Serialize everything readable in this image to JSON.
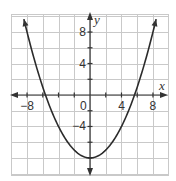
{
  "chart_data": {
    "type": "line",
    "title": "",
    "function": "y = 0.25x^2 - 8",
    "series": [
      {
        "name": "parabola",
        "x": [
          -8.4,
          -8,
          -7,
          -6,
          -5.66,
          -5,
          -4,
          -3,
          -2,
          -1,
          0,
          1,
          2,
          3,
          4,
          5,
          5.66,
          6,
          7,
          8,
          8.4
        ],
        "y": [
          9.64,
          8,
          4.25,
          1,
          0,
          -1.75,
          -4,
          -5.75,
          -7,
          -7.75,
          -8,
          -7.75,
          -7,
          -5.75,
          -4,
          -1.75,
          0,
          1,
          4.25,
          8,
          9.64
        ]
      }
    ],
    "vertex": [
      0,
      -8
    ],
    "x_intercepts": [
      -5.66,
      5.66
    ],
    "xlabel": "x",
    "ylabel": "y",
    "xlim": [
      -10,
      10
    ],
    "ylim": [
      -10,
      10
    ],
    "grid": true,
    "grid_step": 2,
    "x_tick_labels": [
      {
        "value": -8,
        "label": "−8"
      },
      {
        "value": 4,
        "label": "4"
      },
      {
        "value": 8,
        "label": "8"
      }
    ],
    "y_tick_labels": [
      {
        "value": 8,
        "label": "8"
      },
      {
        "value": 4,
        "label": "4"
      },
      {
        "value": -4,
        "label": "−4"
      }
    ],
    "origin_label": "0",
    "colors": {
      "curve": "#2b2b2b",
      "axis": "#333333",
      "grid": "#c9c9c9"
    }
  }
}
